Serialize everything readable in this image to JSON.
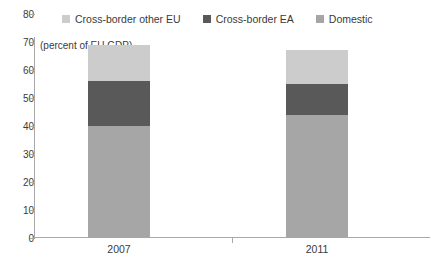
{
  "chart_data": {
    "type": "bar",
    "stacked": true,
    "title": "",
    "subtitle": "(percent of EU GDP)",
    "xlabel": "",
    "ylabel": "",
    "categories": [
      "2007",
      "2011"
    ],
    "ylim": [
      0,
      80
    ],
    "yticks": [
      0,
      10,
      20,
      30,
      40,
      50,
      60,
      70,
      80
    ],
    "grid": false,
    "legend_position": "top",
    "series": [
      {
        "name": "Domestic",
        "values": [
          40,
          44
        ],
        "color": "#a6a6a6"
      },
      {
        "name": "Cross-border EA",
        "values": [
          16,
          11
        ],
        "color": "#595959"
      },
      {
        "name": "Cross-border other EU",
        "values": [
          13,
          12
        ],
        "color": "#cccccc"
      }
    ],
    "totals": [
      69,
      67
    ]
  },
  "legend": {
    "items": [
      {
        "label": "Cross-border other EU",
        "color": "#cccccc"
      },
      {
        "label": "Cross-border EA",
        "color": "#595959"
      },
      {
        "label": "Domestic",
        "color": "#a6a6a6"
      }
    ]
  },
  "axis": {
    "subtitle": "(percent of EU GDP)",
    "y_labels": [
      "80",
      "70",
      "60",
      "50",
      "40",
      "30",
      "20",
      "10",
      "0"
    ],
    "x_labels": [
      "2007",
      "2011"
    ]
  }
}
